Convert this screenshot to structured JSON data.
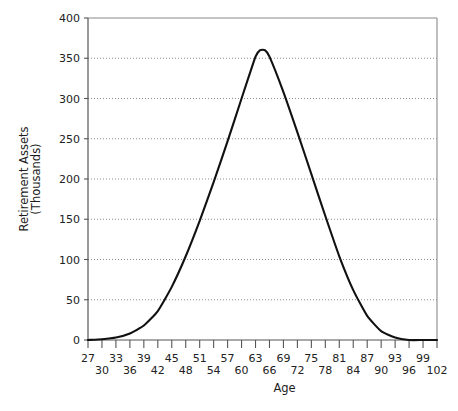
{
  "chart_data": {
    "type": "line",
    "title": "",
    "xlabel": "Age",
    "ylabel": "Retirement Assets (Thousands)",
    "ylabel_line1": "Retirement Assets",
    "ylabel_line2": "(Thousands)",
    "xlim": [
      27,
      102
    ],
    "ylim": [
      0,
      400
    ],
    "grid": true,
    "legend": "none",
    "y_ticks": [
      0,
      50,
      100,
      150,
      200,
      250,
      300,
      350,
      400
    ],
    "y_tick_labels": [
      "0",
      "50",
      "100",
      "150",
      "200",
      "250",
      "300",
      "350",
      "400"
    ],
    "x_ticks": [
      27,
      30,
      33,
      36,
      39,
      42,
      45,
      48,
      51,
      54,
      57,
      60,
      63,
      66,
      69,
      72,
      75,
      78,
      81,
      84,
      87,
      90,
      93,
      96,
      99,
      102
    ],
    "x_tick_labels_upper": [
      "27",
      "33",
      "39",
      "45",
      "51",
      "57",
      "63",
      "69",
      "75",
      "81",
      "87",
      "93",
      "99"
    ],
    "x_tick_labels_lower": [
      "30",
      "36",
      "42",
      "48",
      "54",
      "60",
      "66",
      "72",
      "78",
      "84",
      "90",
      "96",
      "102"
    ],
    "x_tick_labels_upper_values": [
      27,
      33,
      39,
      45,
      51,
      57,
      63,
      69,
      75,
      81,
      87,
      93,
      99
    ],
    "x_tick_labels_lower_values": [
      30,
      36,
      42,
      48,
      54,
      60,
      66,
      72,
      78,
      84,
      90,
      96,
      102
    ],
    "series": [
      {
        "name": "Retirement Assets",
        "color": "#111111",
        "x": [
          27,
          30,
          33,
          36,
          39,
          42,
          45,
          48,
          51,
          54,
          57,
          60,
          63,
          64,
          65,
          66,
          69,
          72,
          75,
          78,
          81,
          84,
          87,
          90,
          93,
          96,
          99,
          102
        ],
        "values": [
          0,
          1,
          3,
          8,
          18,
          36,
          66,
          104,
          148,
          196,
          247,
          300,
          352,
          360,
          360,
          352,
          308,
          258,
          206,
          154,
          104,
          62,
          30,
          11,
          3,
          0,
          0,
          0
        ]
      }
    ]
  },
  "axis": {
    "y_axis_name": "y-axis",
    "x_axis_name": "x-axis"
  }
}
